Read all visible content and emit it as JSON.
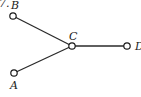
{
  "figure": {
    "number_fragment": "7.",
    "nodes": [
      {
        "id": "B",
        "label": "B",
        "x": 13,
        "y": 16,
        "label_x": 11,
        "label_y": 9
      },
      {
        "id": "C",
        "label": "C",
        "x": 72,
        "y": 46,
        "label_x": 70,
        "label_y": 39
      },
      {
        "id": "D",
        "label": "D",
        "x": 127,
        "y": 46,
        "label_x": 135,
        "label_y": 50
      },
      {
        "id": "A",
        "label": "A",
        "x": 14,
        "y": 73,
        "label_x": 11,
        "label_y": 89
      }
    ],
    "edges": [
      {
        "from": "B",
        "to": "C"
      },
      {
        "from": "A",
        "to": "C"
      },
      {
        "from": "C",
        "to": "D"
      }
    ]
  }
}
